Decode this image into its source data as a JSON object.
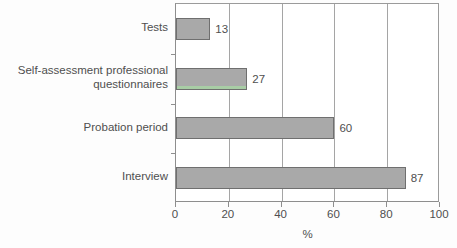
{
  "chart_data": {
    "type": "bar",
    "orientation": "horizontal",
    "title": "",
    "xlabel": "%",
    "ylabel": "",
    "categories": [
      "Tests",
      "Self-assessment professional\nquestionnaires",
      "Probation period",
      "Interview"
    ],
    "values": [
      13,
      27,
      60,
      87
    ],
    "value_labels": [
      "13",
      "27",
      "60",
      "87"
    ],
    "xlim": [
      0,
      100
    ],
    "xticks": [
      0,
      20,
      40,
      60,
      80,
      100
    ],
    "xtick_labels": [
      "0",
      "20",
      "40",
      "60",
      "80",
      "100"
    ],
    "grid": "vertical",
    "legend": "none",
    "colors": {
      "bar_fill": "#a9a9a9",
      "bar_border": "#6f6f6f",
      "gridline": "#a5a5a5",
      "axis": "#8e8e8e",
      "text": "#4f4f4f",
      "background": "#fdfdfd",
      "artifact_band": "#a8d3a5"
    }
  }
}
